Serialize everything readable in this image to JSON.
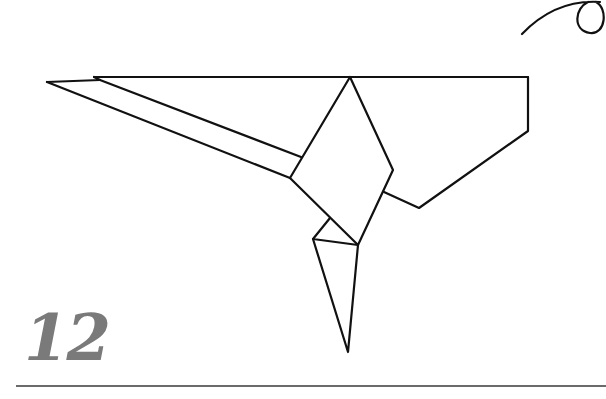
{
  "step": {
    "number": "12"
  },
  "colors": {
    "line": "#111111",
    "step_number": "#7a7a7a",
    "rule": "#6a6a6a"
  },
  "diagram": {
    "type": "origami-step",
    "arrow": {
      "type": "curved-loop-arrow",
      "position": "top-right"
    }
  }
}
